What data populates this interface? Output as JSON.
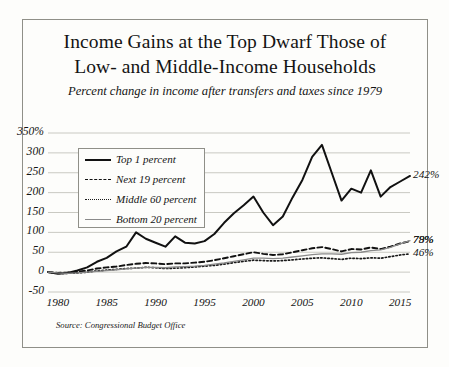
{
  "figure": {
    "title_line1": "Income Gains at the Top Dwarf Those of",
    "title_line2": "Low- and Middle-Income Households",
    "subtitle": "Percent change in income after transfers and taxes since 1979",
    "source": "Source: Congressional Budget Office"
  },
  "colors": {
    "background": "#fdfdfb",
    "frame": "#8f8f88",
    "gridline": "#c9c9c2",
    "top1": "#111111",
    "next19": "#111111",
    "middle60": "#1a1a1a",
    "bottom20": "#8a8a8a",
    "text": "#141414"
  },
  "axes": {
    "y_ticks": [
      "350%",
      "300",
      "250",
      "200",
      "150",
      "100",
      "50",
      "0",
      "-50"
    ],
    "y_values": [
      350,
      300,
      250,
      200,
      150,
      100,
      50,
      0,
      -50
    ],
    "ylim": [
      -50,
      350
    ],
    "x_ticks": [
      "1980",
      "1985",
      "1990",
      "1995",
      "2000",
      "2005",
      "2010",
      "2015"
    ],
    "x_values": [
      1980,
      1985,
      1990,
      1995,
      2000,
      2005,
      2010,
      2015
    ],
    "xlim": [
      1979,
      2016
    ],
    "grid": true
  },
  "legend": {
    "position": "upper-left-inset",
    "items": [
      {
        "label": "Top 1 percent",
        "style": "solid",
        "width": 2.0,
        "color": "#111111"
      },
      {
        "label": "Next 19 percent",
        "style": "dashed",
        "width": 1.9,
        "color": "#111111"
      },
      {
        "label": "Middle 60 percent",
        "style": "dotted",
        "width": 1.7,
        "color": "#1a1a1a"
      },
      {
        "label": "Bottom 20 percent",
        "style": "solid",
        "width": 1.3,
        "color": "#8a8a8a"
      }
    ]
  },
  "end_labels": [
    {
      "text": "242%",
      "series": "Top 1 percent",
      "value": 242
    },
    {
      "text": "79%",
      "series": "Bottom 20 percent",
      "value": 79
    },
    {
      "text": "78%",
      "series": "Next 19 percent",
      "value": 78
    },
    {
      "text": "46%",
      "series": "Middle 60 percent",
      "value": 46
    }
  ],
  "chart_data": {
    "type": "line",
    "title": "Income Gains at the Top Dwarf Those of Low- and Middle-Income Households",
    "subtitle": "Percent change in income after transfers and taxes since 1979",
    "xlabel": "",
    "ylabel": "",
    "xlim": [
      1979,
      2016
    ],
    "ylim": [
      -50,
      350
    ],
    "grid": true,
    "legend_position": "upper left",
    "source": "Source: Congressional Budget Office",
    "x": [
      1979,
      1980,
      1981,
      1982,
      1983,
      1984,
      1985,
      1986,
      1987,
      1988,
      1989,
      1990,
      1991,
      1992,
      1993,
      1994,
      1995,
      1996,
      1997,
      1998,
      1999,
      2000,
      2001,
      2002,
      2003,
      2004,
      2005,
      2006,
      2007,
      2008,
      2009,
      2010,
      2011,
      2012,
      2013,
      2014,
      2015,
      2016
    ],
    "series": [
      {
        "name": "Top 1 percent",
        "style": "solid",
        "color": "#111111",
        "end_label": "242%",
        "values": [
          0,
          -4,
          -2,
          4,
          12,
          26,
          36,
          52,
          64,
          100,
          84,
          74,
          64,
          90,
          74,
          72,
          78,
          96,
          124,
          148,
          168,
          190,
          150,
          118,
          140,
          188,
          232,
          290,
          320,
          250,
          180,
          210,
          200,
          256,
          190,
          214,
          228,
          242
        ]
      },
      {
        "name": "Next 19 percent",
        "style": "dashed",
        "color": "#111111",
        "end_label": "78%",
        "values": [
          0,
          -2,
          -1,
          1,
          4,
          9,
          12,
          14,
          18,
          21,
          23,
          22,
          20,
          22,
          22,
          24,
          26,
          30,
          35,
          40,
          45,
          50,
          46,
          43,
          45,
          50,
          55,
          60,
          63,
          58,
          52,
          58,
          57,
          62,
          58,
          64,
          72,
          78
        ]
      },
      {
        "name": "Middle 60 percent",
        "style": "dotted",
        "color": "#1a1a1a",
        "end_label": "46%",
        "values": [
          0,
          -3,
          -3,
          -2,
          0,
          3,
          5,
          7,
          9,
          10,
          12,
          11,
          9,
          10,
          11,
          13,
          15,
          17,
          20,
          24,
          27,
          30,
          29,
          28,
          29,
          31,
          33,
          35,
          36,
          34,
          32,
          35,
          34,
          36,
          35,
          39,
          43,
          46
        ]
      },
      {
        "name": "Bottom 20 percent",
        "style": "solid",
        "color": "#8a8a8a",
        "end_label": "79%",
        "values": [
          0,
          -2,
          -3,
          -2,
          0,
          2,
          4,
          6,
          8,
          10,
          12,
          12,
          11,
          13,
          14,
          15,
          17,
          20,
          23,
          27,
          31,
          35,
          35,
          34,
          35,
          38,
          41,
          44,
          46,
          46,
          45,
          49,
          50,
          54,
          56,
          62,
          71,
          79
        ]
      }
    ]
  }
}
